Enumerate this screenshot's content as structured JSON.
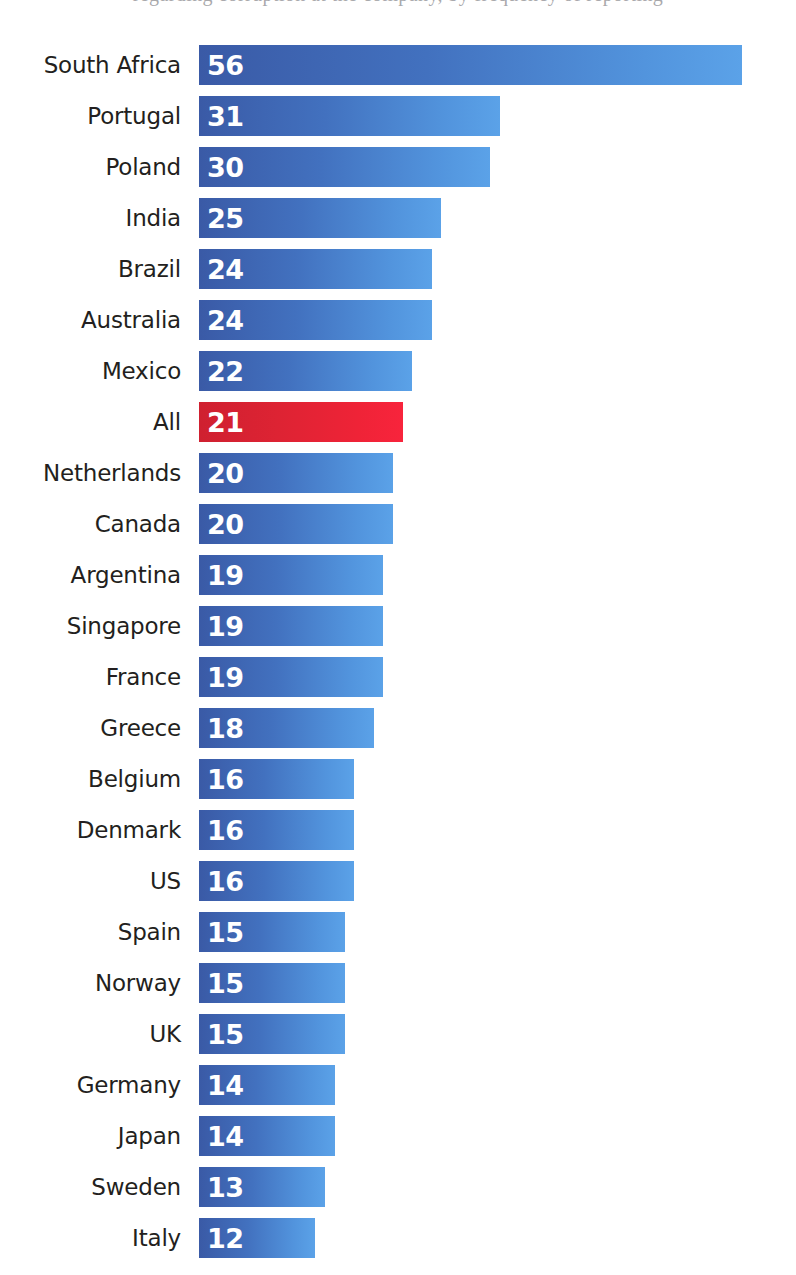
{
  "page": {
    "background_color": "#ffffff",
    "clipped_header_text": "regarding corruption at the company, by frequency of reporting"
  },
  "style": {
    "bar_gradient_start": "#3a5aa6",
    "bar_gradient_end": "#5ba2e8",
    "accent_gradient_start": "#cf2030",
    "accent_gradient_end": "#f8243c",
    "label_color": "#231f20",
    "value_color": "#ffffff"
  },
  "chart_data": {
    "type": "bar",
    "orientation": "horizontal",
    "title": "",
    "subtitle": "",
    "xlabel": "",
    "ylabel": "",
    "xlim": [
      0,
      56
    ],
    "grid": false,
    "legend": false,
    "value_labels_inside_bars": true,
    "sorted": "descending",
    "highlight_category": "All",
    "highlight_color": "#ef2337",
    "categories": [
      "South Africa",
      "Portugal",
      "Poland",
      "India",
      "Brazil",
      "Australia",
      "Mexico",
      "All",
      "Netherlands",
      "Canada",
      "Argentina",
      "Singapore",
      "France",
      "Greece",
      "Belgium",
      "Denmark",
      "US",
      "Spain",
      "Norway",
      "UK",
      "Germany",
      "Japan",
      "Sweden",
      "Italy"
    ],
    "values": [
      56,
      31,
      30,
      25,
      24,
      24,
      22,
      21,
      20,
      20,
      19,
      19,
      19,
      18,
      16,
      16,
      16,
      15,
      15,
      15,
      14,
      14,
      13,
      12
    ],
    "bars": [
      {
        "label": "South Africa",
        "value": 56,
        "highlight": true,
        "accent": false
      },
      {
        "label": "Portugal",
        "value": 31,
        "highlight": false,
        "accent": false
      },
      {
        "label": "Poland",
        "value": 30,
        "highlight": false,
        "accent": false
      },
      {
        "label": "India",
        "value": 25,
        "highlight": false,
        "accent": false
      },
      {
        "label": "Brazil",
        "value": 24,
        "highlight": false,
        "accent": false
      },
      {
        "label": "Australia",
        "value": 24,
        "highlight": false,
        "accent": false
      },
      {
        "label": "Mexico",
        "value": 22,
        "highlight": false,
        "accent": false
      },
      {
        "label": "All",
        "value": 21,
        "highlight": false,
        "accent": true
      },
      {
        "label": "Netherlands",
        "value": 20,
        "highlight": false,
        "accent": false
      },
      {
        "label": "Canada",
        "value": 20,
        "highlight": false,
        "accent": false
      },
      {
        "label": "Argentina",
        "value": 19,
        "highlight": false,
        "accent": false
      },
      {
        "label": "Singapore",
        "value": 19,
        "highlight": false,
        "accent": false
      },
      {
        "label": "France",
        "value": 19,
        "highlight": false,
        "accent": false
      },
      {
        "label": "Greece",
        "value": 18,
        "highlight": false,
        "accent": false
      },
      {
        "label": "Belgium",
        "value": 16,
        "highlight": false,
        "accent": false
      },
      {
        "label": "Denmark",
        "value": 16,
        "highlight": false,
        "accent": false
      },
      {
        "label": "US",
        "value": 16,
        "highlight": false,
        "accent": false
      },
      {
        "label": "Spain",
        "value": 15,
        "highlight": false,
        "accent": false
      },
      {
        "label": "Norway",
        "value": 15,
        "highlight": false,
        "accent": false
      },
      {
        "label": "UK",
        "value": 15,
        "highlight": false,
        "accent": false
      },
      {
        "label": "Germany",
        "value": 14,
        "highlight": false,
        "accent": false
      },
      {
        "label": "Japan",
        "value": 14,
        "highlight": false,
        "accent": false
      },
      {
        "label": "Sweden",
        "value": 13,
        "highlight": false,
        "accent": false
      },
      {
        "label": "Italy",
        "value": 12,
        "highlight": false,
        "accent": false
      }
    ]
  }
}
